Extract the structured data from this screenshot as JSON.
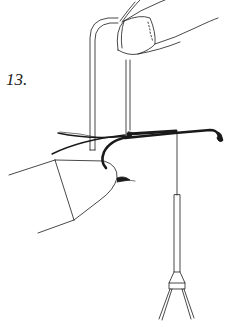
{
  "figure": {
    "step_number": "13.",
    "colors": {
      "ink": "#1a1a1a",
      "background": "#ffffff"
    },
    "parts": [
      "finger-top",
      "u-loop",
      "hook",
      "thread-wraps",
      "hanging-thread",
      "bobbin",
      "holding-fingers"
    ]
  }
}
